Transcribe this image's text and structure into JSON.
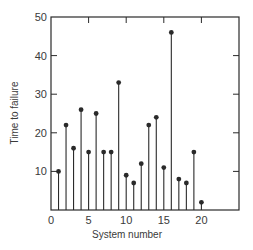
{
  "chart_data": {
    "type": "scatter",
    "style": "stem",
    "title": "",
    "xlabel": "System number",
    "ylabel": "Time to failure",
    "xlim": [
      0,
      25
    ],
    "ylim": [
      0,
      50
    ],
    "xticks": [
      0,
      5,
      10,
      15,
      20
    ],
    "yticks": [
      10,
      20,
      30,
      40,
      50
    ],
    "grid": false,
    "legend": null,
    "x": [
      1,
      2,
      3,
      4,
      5,
      6,
      7,
      8,
      9,
      10,
      11,
      12,
      13,
      14,
      15,
      16,
      17,
      18,
      19,
      20
    ],
    "values": [
      10,
      22,
      16,
      26,
      15,
      25,
      15,
      15,
      33,
      9,
      7,
      12,
      22,
      24,
      11,
      46,
      8,
      7,
      15,
      2
    ]
  },
  "colors": {
    "ink": "#2a2a2a",
    "background": "#ffffff"
  }
}
